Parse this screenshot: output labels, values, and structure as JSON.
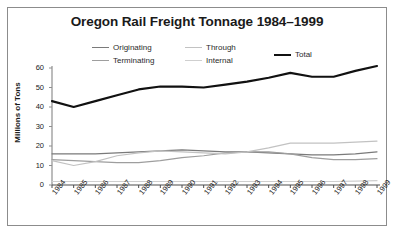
{
  "figure": {
    "title": "Oregon Rail Freight Tonnage 1984–1999",
    "border_color": "#8c8c8c",
    "background": "#ffffff"
  },
  "axis": {
    "ylabel": "Millions of Tons",
    "yticks": [
      "0",
      "10",
      "20",
      "30",
      "40",
      "50",
      "60"
    ],
    "xticks": [
      "1984",
      "1985",
      "1986",
      "1987",
      "1988",
      "1989",
      "1990",
      "1991",
      "1992",
      "1993",
      "1994",
      "1995",
      "1996",
      "1997",
      "1998",
      "1999"
    ]
  },
  "legend": {
    "entries": [
      {
        "label": "Originating",
        "color": "#7a7a7a",
        "width": 1.4
      },
      {
        "label": "Terminating",
        "color": "#9e9e9e",
        "width": 1.4
      },
      {
        "label": "Through",
        "color": "#c2c2c2",
        "width": 1.4
      },
      {
        "label": "Internal",
        "color": "#cfcfcf",
        "width": 1.4
      },
      {
        "label": "Total",
        "color": "#111111",
        "width": 2.4
      }
    ]
  },
  "chart_data": {
    "type": "line",
    "title": "Oregon Rail Freight Tonnage 1984–1999",
    "xlabel": "",
    "ylabel": "Millions of Tons",
    "xlim": [
      1984,
      1999
    ],
    "ylim": [
      0,
      60
    ],
    "grid": false,
    "legend_position": "top-center",
    "x": [
      1984,
      1985,
      1986,
      1987,
      1988,
      1989,
      1990,
      1991,
      1992,
      1993,
      1994,
      1995,
      1996,
      1997,
      1998,
      1999
    ],
    "categories": [
      "1984",
      "1985",
      "1986",
      "1987",
      "1988",
      "1989",
      "1990",
      "1991",
      "1992",
      "1993",
      "1994",
      "1995",
      "1996",
      "1997",
      "1998",
      "1999"
    ],
    "series": [
      {
        "name": "Total",
        "color": "#111111",
        "values": [
          43,
          40,
          43,
          46,
          49,
          50.5,
          50.5,
          50,
          51.5,
          53,
          55,
          57.5,
          55.5,
          55.5,
          58.5,
          61
        ]
      },
      {
        "name": "Originating",
        "color": "#7a7a7a",
        "values": [
          16,
          16,
          16,
          16.5,
          17,
          17.5,
          18,
          17.5,
          17,
          17,
          16.5,
          16,
          15.5,
          15.5,
          16,
          17
        ]
      },
      {
        "name": "Terminating",
        "color": "#9e9e9e",
        "values": [
          13,
          12.5,
          12,
          11.5,
          11.5,
          12.5,
          14,
          15,
          16.5,
          17,
          17,
          16,
          14,
          13,
          13,
          13.5
        ]
      },
      {
        "name": "Through",
        "color": "#c2c2c2",
        "values": [
          12.5,
          10,
          12,
          15,
          16.5,
          17.5,
          17,
          16.5,
          16,
          17,
          19,
          21.5,
          21.5,
          21.5,
          22,
          22.5
        ]
      },
      {
        "name": "Internal",
        "color": "#cfcfcf",
        "values": [
          1.8,
          1.8,
          1.8,
          1.8,
          1.8,
          1.8,
          1.8,
          1.8,
          1.8,
          1.8,
          1.8,
          1.8,
          1.8,
          1.8,
          2.0,
          2.2
        ]
      }
    ]
  }
}
